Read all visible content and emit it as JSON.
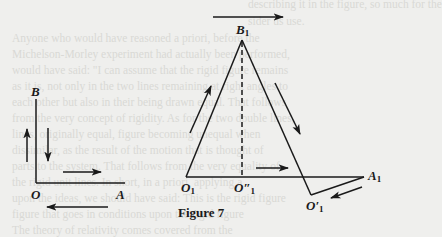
{
  "figure": {
    "caption": "Figure 7",
    "labels": {
      "B": "B",
      "O": "O",
      "A": "A",
      "B1": "B",
      "B1_sub": "1",
      "O1": "O",
      "O1_sub": "1",
      "O2": "O″",
      "O2_sub": "1",
      "O3": "O′",
      "O3_sub": "1",
      "A1": "A",
      "A1_sub": "1"
    },
    "colors": {
      "ink": "#1a1a1a",
      "paper": "#efefed",
      "showthrough": "#d9d9d5"
    }
  },
  "showthrough_text": [
    "describing it in the figure, so much for the",
    "sider us use.",
    "Anyone who would have reasoned a priori, before the",
    "Michelson-Morley experiment had actually been performed,",
    "would have said: \"I can assume that the rigid figure remains",
    "as it is, not only in the two lines remaining at right angles to",
    "each other but also in their being drawn equal. That follows",
    "from the very concept of rigidity. As for the two double lines,",
    "lines, originally equal, figure becoming unequal when",
    "dissimilar, as the result of the motion that is thought of",
    "parts to the system. That follows from the very equality of",
    "the rigid unit lines. In short, in a priori, applying a",
    "upon the ideas, we should have said: This is the rigid figure",
    "figure that goes in conditions upon the rigid figure",
    "The theory of relativity comes covered from the"
  ]
}
